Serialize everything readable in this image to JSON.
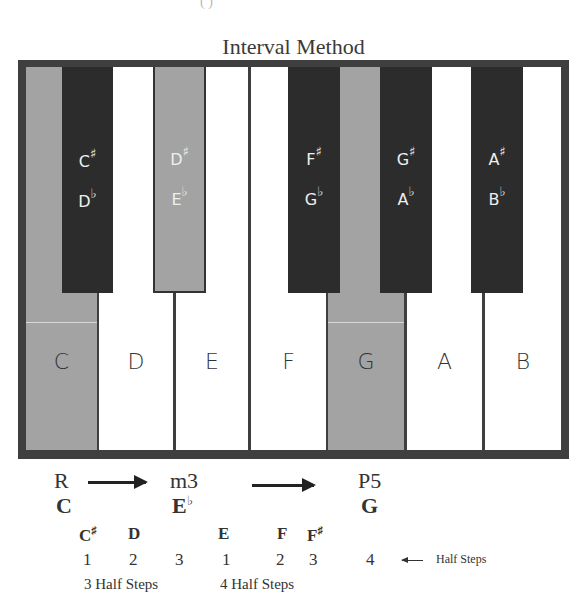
{
  "header": {
    "partial_top_text": "(                  )",
    "title": "Interval Method"
  },
  "colors": {
    "frame": "#3f3f3f",
    "black_key": "#2c2c2c",
    "highlight_key": "#a3a3a3",
    "white_key": "#ffffff"
  },
  "keyboard": {
    "white_keys": [
      {
        "label": "C",
        "highlighted": true
      },
      {
        "label": "D",
        "highlighted": false
      },
      {
        "label": "E",
        "highlighted": false
      },
      {
        "label": "F",
        "highlighted": false
      },
      {
        "label": "G",
        "highlighted": true
      },
      {
        "label": "A",
        "highlighted": false
      },
      {
        "label": "B",
        "highlighted": false
      }
    ],
    "black_keys": [
      {
        "sharp": "C",
        "flat": "D",
        "highlighted": false
      },
      {
        "sharp": "D",
        "flat": "E",
        "highlighted": true
      },
      {
        "sharp": "F",
        "flat": "G",
        "highlighted": false
      },
      {
        "sharp": "G",
        "flat": "A",
        "highlighted": false
      },
      {
        "sharp": "A",
        "flat": "B",
        "highlighted": false
      }
    ],
    "sharp_symbol": "♯",
    "flat_symbol": "♭"
  },
  "intervals": {
    "root": {
      "interval": "R",
      "note": "C"
    },
    "third": {
      "interval": "m3",
      "note": "E",
      "accidental": "♭"
    },
    "fifth": {
      "interval": "P5",
      "note": "G"
    }
  },
  "steps": {
    "notes": [
      {
        "name": "C",
        "acc": "♯"
      },
      {
        "name": "D",
        "acc": ""
      },
      {
        "name": "E",
        "acc": ""
      },
      {
        "name": "F",
        "acc": ""
      },
      {
        "name": "F",
        "acc": "♯"
      }
    ],
    "counts": [
      "1",
      "2",
      "3",
      "1",
      "2",
      "3",
      "4"
    ],
    "group1_label": "3 Half Steps",
    "group2_label": "4 Half Steps",
    "legend_label": "Half Steps"
  }
}
